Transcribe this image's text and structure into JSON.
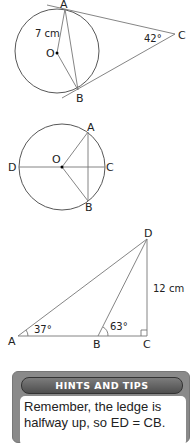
{
  "figure1": {
    "points": {
      "A": "A",
      "B": "B",
      "C": "C",
      "O": "O"
    },
    "radius_label": "7 cm",
    "angle_label": "42°"
  },
  "figure2": {
    "points": {
      "A": "A",
      "B": "B",
      "C": "C",
      "D": "D",
      "O": "O"
    }
  },
  "figure3": {
    "points": {
      "A": "A",
      "B": "B",
      "C": "C",
      "D": "D"
    },
    "height_label": "12 cm",
    "angle_A": "37°",
    "angle_B": "63°"
  },
  "hints": {
    "title": "HINTS AND TIPS",
    "text": "Remember, the ledge is halfway up, so ED = CB."
  }
}
